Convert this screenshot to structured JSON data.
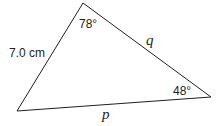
{
  "diagram": {
    "type": "triangle",
    "vertices": {
      "top": [
        83,
        3
      ],
      "bottom_left": [
        17,
        111
      ],
      "right": [
        211,
        97
      ]
    },
    "sides": {
      "left": "7.0 cm",
      "right": "q",
      "bottom": "p"
    },
    "angles": {
      "top": "78°",
      "right": "48°"
    },
    "stroke_color": "#231f20"
  }
}
